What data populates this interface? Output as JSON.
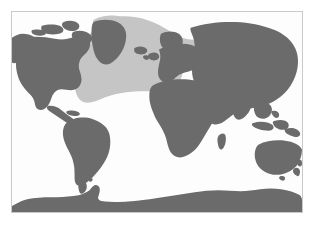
{
  "figure": {
    "type": "species-distribution-map",
    "caption": "",
    "background_color": "#ffffff"
  },
  "map": {
    "projection": "cylindrical-equirectangular",
    "frame": {
      "border_color": "#c9c9c9",
      "left": 11,
      "top": 11,
      "width": 292,
      "height": 202
    },
    "ocean_color": "#fdfdfd",
    "land_color": "#6b6b6b",
    "distribution_color": "#c5c5c5",
    "lon_range": [
      -180,
      180
    ],
    "lat_range": [
      -90,
      90
    ]
  },
  "legend": {
    "land_label": "Land",
    "distribution_label": "Distribution range",
    "ocean_label": "Ocean"
  },
  "regions": [
    {
      "name": "north-america",
      "label": "North America"
    },
    {
      "name": "greenland",
      "label": "Greenland"
    },
    {
      "name": "south-america",
      "label": "South America"
    },
    {
      "name": "africa",
      "label": "Africa"
    },
    {
      "name": "europe",
      "label": "Europe"
    },
    {
      "name": "asia",
      "label": "Asia"
    },
    {
      "name": "australia",
      "label": "Australia"
    },
    {
      "name": "new-zealand",
      "label": "New Zealand"
    },
    {
      "name": "antarctica",
      "label": "Antarctica"
    },
    {
      "name": "madagascar",
      "label": "Madagascar"
    },
    {
      "name": "japan",
      "label": "Japan"
    },
    {
      "name": "british-isles",
      "label": "British Isles"
    },
    {
      "name": "iceland",
      "label": "Iceland"
    }
  ],
  "distribution": {
    "name": "north-atlantic-range",
    "label": "North Atlantic distribution range",
    "ocean_basin": "North Atlantic Ocean",
    "approx_lat_range": [
      15,
      70
    ],
    "approx_lon_range": [
      -75,
      20
    ],
    "fill_color": "#c5c5c5"
  }
}
